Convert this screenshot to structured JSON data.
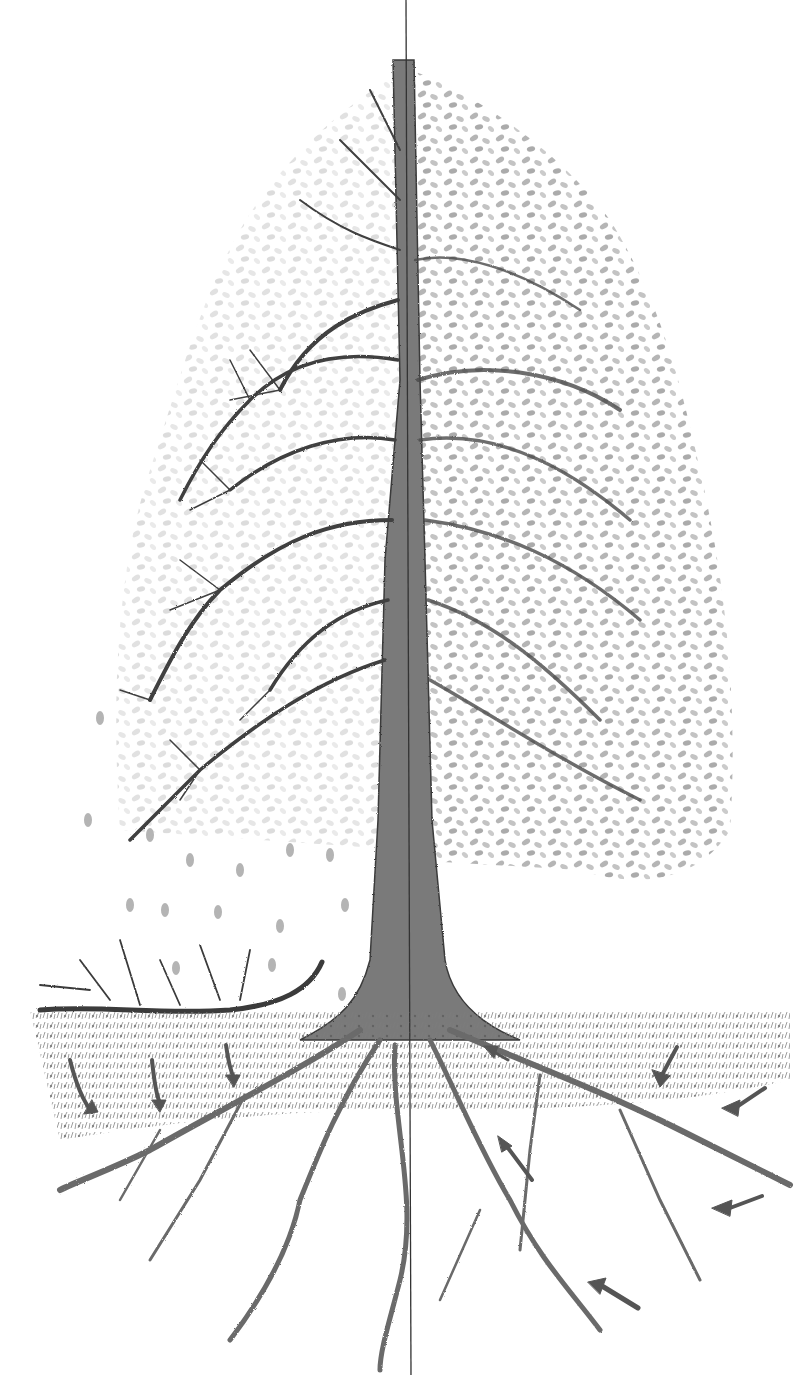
{
  "illustration": {
    "subject": "pencil drawing of a tree split vertically: bare branches on left half, leafy crown on right half, with roots and nutrient-flow arrows",
    "colors": {
      "background": "#ffffff",
      "pencil_dark": "#3a3a3a",
      "pencil_mid": "#6e6e6e",
      "leaf": "#9a9a9a",
      "leaf_light": "#c4c4c4",
      "ground": "#8a8a8a",
      "arrow": "#555555"
    },
    "elements": {
      "divider_line": "vertical center line through tree",
      "left_half": "bare winter branches",
      "right_half": "leaf-covered summer crown",
      "falling_leaves": "leaves falling on left side",
      "fallen_branch": "dead branch lying on ground, left",
      "ground_layer": "litter / soil layer",
      "roots": "spreading root system",
      "arrows_left": 3,
      "arrows_right": 6
    }
  }
}
